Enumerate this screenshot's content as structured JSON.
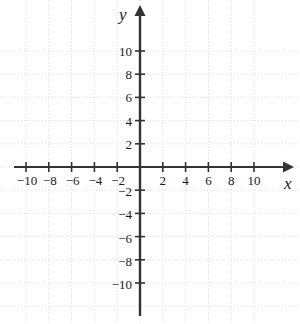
{
  "chart_data": {
    "type": "scatter",
    "title": "",
    "xlabel": "x",
    "ylabel": "y",
    "xlim": [
      -11.5,
      11.5
    ],
    "ylim": [
      -12.5,
      11
    ],
    "grid": true,
    "grid_style": "dotted",
    "grid_step": 2,
    "legend": null,
    "series": [],
    "x_tick_values": [
      -10,
      -8,
      -6,
      -4,
      -2,
      2,
      4,
      6,
      8,
      10
    ],
    "y_tick_values": [
      10,
      8,
      6,
      4,
      2,
      -2,
      -4,
      -6,
      -8,
      -10
    ],
    "x_tick_labels": [
      "−10",
      "−8",
      "−6",
      "−4",
      "−2",
      "2",
      "4",
      "6",
      "8",
      "10"
    ],
    "y_tick_labels": [
      "10",
      "8",
      "6",
      "4",
      "2",
      "−2",
      "−4",
      "−6",
      "−8",
      "−10"
    ],
    "annotations": [],
    "data_points": [],
    "colors": {
      "axis": "#333333",
      "grid": "#dcdcdc",
      "label": "#1a1a1a",
      "background": "#ffffff"
    }
  },
  "axes": {
    "x_axis_label": "x",
    "y_axis_label": "y",
    "x_arrow": "right-arrow",
    "y_arrow": "up-arrow"
  },
  "x_ticks": [
    {
      "value": -10,
      "label": "−10"
    },
    {
      "value": -8,
      "label": "−8"
    },
    {
      "value": -6,
      "label": "−6"
    },
    {
      "value": -4,
      "label": "−4"
    },
    {
      "value": -2,
      "label": "−2"
    },
    {
      "value": 2,
      "label": "2"
    },
    {
      "value": 4,
      "label": "4"
    },
    {
      "value": 6,
      "label": "6"
    },
    {
      "value": 8,
      "label": "8"
    },
    {
      "value": 10,
      "label": "10"
    }
  ],
  "y_ticks": [
    {
      "value": 10,
      "label": "10"
    },
    {
      "value": 8,
      "label": "8"
    },
    {
      "value": 6,
      "label": "6"
    },
    {
      "value": 4,
      "label": "4"
    },
    {
      "value": 2,
      "label": "2"
    },
    {
      "value": -2,
      "label": "−2"
    },
    {
      "value": -4,
      "label": "−4"
    },
    {
      "value": -6,
      "label": "−6"
    },
    {
      "value": -8,
      "label": "−8"
    },
    {
      "value": -10,
      "label": "−10"
    }
  ]
}
